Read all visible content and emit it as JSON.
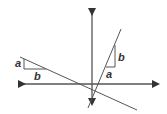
{
  "diagram": {
    "colors": {
      "axis": "#333333",
      "line": "#444444",
      "background": "#ffffff"
    },
    "labels": {
      "left_triangle": {
        "vertical": "a",
        "horizontal": "b"
      },
      "right_triangle": {
        "vertical": "b",
        "horizontal": "a"
      }
    }
  }
}
